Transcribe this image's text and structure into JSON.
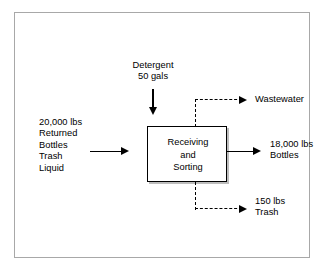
{
  "diagram": {
    "process": {
      "name": "Receiving and Sorting",
      "label": "Receiving\nand\nSorting"
    },
    "inputs": [
      {
        "id": "returned-bottles",
        "label": "20,000 lbs\nReturned\nBottles\nTrash\nLiquid",
        "quantity": "20,000 lbs",
        "direction": "right",
        "style": "solid"
      },
      {
        "id": "detergent",
        "label": "Detergent\n50 gals",
        "quantity": "50 gals",
        "direction": "down",
        "style": "solid"
      }
    ],
    "outputs": [
      {
        "id": "wastewater",
        "label": "Wastewater",
        "quantity": "",
        "direction": "right",
        "style": "dashed"
      },
      {
        "id": "bottles",
        "label": "18,000 lbs\nBottles",
        "quantity": "18,000 lbs",
        "direction": "right",
        "style": "solid"
      },
      {
        "id": "trash",
        "label": "150 lbs\nTrash",
        "quantity": "150 lbs",
        "direction": "right",
        "style": "dashed"
      }
    ],
    "colors": {
      "line": "#000000",
      "frame": "#a8a8a8",
      "box_shadow": "#bdbdbd",
      "background": "#ffffff"
    }
  }
}
